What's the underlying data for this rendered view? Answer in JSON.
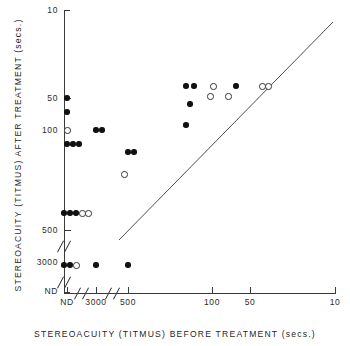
{
  "chart_data": {
    "type": "scatter",
    "title": "",
    "xlabel": "STEREOACUITY  (TITMUS)  BEFORE  TREATMENT  (secs.)",
    "ylabel": "STEREOACUITY  (TITMUS)  AFTER  TREATMENT  (secs.)",
    "x_tick_labels": [
      "ND",
      "3000",
      "500",
      "100",
      "50",
      "10"
    ],
    "y_tick_labels": [
      "10",
      "50",
      "100",
      "500",
      "3000",
      "ND"
    ],
    "x_axis_note": "reversed log scale with axis breaks between ND/3000 and 3000/500",
    "y_axis_note": "reversed log scale with axis breaks between 500/3000 and 3000/ND",
    "grid": false,
    "legend": null,
    "reference_line": {
      "label": "line of no change (y = x)",
      "from": {
        "x": "500",
        "y": "500"
      },
      "to": {
        "x": "10",
        "y": "10"
      }
    },
    "series": [
      {
        "name": "filled circle",
        "marker": "filled",
        "points": [
          {
            "x": "ND",
            "y": "50"
          },
          {
            "x": "ND",
            "y": "70"
          },
          {
            "x": "ND",
            "y": "130"
          },
          {
            "x": "ND",
            "y": "130"
          },
          {
            "x": "ND",
            "y": "130"
          },
          {
            "x": "ND",
            "y": "450"
          },
          {
            "x": "ND",
            "y": "450"
          },
          {
            "x": "ND",
            "y": "450"
          },
          {
            "x": "ND",
            "y": "3000"
          },
          {
            "x": "ND",
            "y": "3000"
          },
          {
            "x": "3000",
            "y": "100"
          },
          {
            "x": "3000",
            "y": "100"
          },
          {
            "x": "3000",
            "y": "3000"
          },
          {
            "x": "500",
            "y": "130"
          },
          {
            "x": "500",
            "y": "130"
          },
          {
            "x": "500",
            "y": "3000"
          },
          {
            "x": "140",
            "y": "50"
          },
          {
            "x": "140",
            "y": "50"
          },
          {
            "x": "140",
            "y": "100"
          },
          {
            "x": "140",
            "y": "180"
          },
          {
            "x": "60",
            "y": "50"
          }
        ]
      },
      {
        "name": "open circle",
        "marker": "open",
        "points": [
          {
            "x": "ND",
            "y": "100"
          },
          {
            "x": "ND",
            "y": "450"
          },
          {
            "x": "ND",
            "y": "450"
          },
          {
            "x": "ND",
            "y": "3000"
          },
          {
            "x": "500",
            "y": "230"
          },
          {
            "x": "100",
            "y": "50"
          },
          {
            "x": "100",
            "y": "62"
          },
          {
            "x": "80",
            "y": "62"
          },
          {
            "x": "50",
            "y": "50"
          },
          {
            "x": "48",
            "y": "50"
          }
        ]
      }
    ]
  },
  "axes": {
    "x_title": "STEREOACUITY  (TITMUS)  BEFORE  TREATMENT  (secs.)",
    "y_title": "STEREOACUITY  (TITMUS)  AFTER  TREATMENT  (secs.)",
    "x_ticks": [
      {
        "label": "ND",
        "px": 67
      },
      {
        "label": "3000",
        "px": 96
      },
      {
        "label": "500",
        "px": 128
      },
      {
        "label": "100",
        "px": 212
      },
      {
        "label": "50",
        "px": 250
      },
      {
        "label": "10",
        "px": 335
      }
    ],
    "y_ticks": [
      {
        "label": "10",
        "px": 10
      },
      {
        "label": "50",
        "px": 98
      },
      {
        "label": "100",
        "px": 130
      },
      {
        "label": "500",
        "px": 230
      },
      {
        "label": "3000",
        "px": 262
      },
      {
        "label": "ND",
        "px": 291
      }
    ]
  },
  "markers": {
    "filled_px": [
      [
        67,
        98
      ],
      [
        67,
        112
      ],
      [
        67,
        144
      ],
      [
        73,
        144
      ],
      [
        79,
        144
      ],
      [
        64,
        213
      ],
      [
        70,
        213
      ],
      [
        76,
        213
      ],
      [
        64,
        265
      ],
      [
        70,
        265
      ],
      [
        96,
        130
      ],
      [
        102,
        130
      ],
      [
        96,
        265
      ],
      [
        128,
        152
      ],
      [
        134,
        152
      ],
      [
        128,
        265
      ],
      [
        186,
        86
      ],
      [
        194,
        86
      ],
      [
        190,
        104
      ],
      [
        186,
        125
      ],
      [
        236,
        86
      ]
    ],
    "open_px": [
      [
        67,
        130
      ],
      [
        82,
        213
      ],
      [
        88,
        213
      ],
      [
        76,
        265
      ],
      [
        124,
        174
      ],
      [
        213,
        86
      ],
      [
        210,
        96
      ],
      [
        228,
        96
      ],
      [
        262,
        86
      ],
      [
        268,
        86
      ]
    ]
  },
  "reference_line_px": {
    "x1": 119,
    "y1": 240,
    "x2": 333,
    "y2": 22
  }
}
